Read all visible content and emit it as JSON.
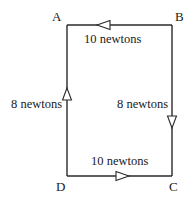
{
  "diagram": {
    "type": "force-loop",
    "vertices": {
      "A": {
        "label": "A",
        "x": 67,
        "y": 25
      },
      "B": {
        "label": "B",
        "x": 172,
        "y": 25
      },
      "C": {
        "label": "C",
        "x": 172,
        "y": 176
      },
      "D": {
        "label": "D",
        "x": 67,
        "y": 176
      }
    },
    "edges": [
      {
        "from": "B",
        "to": "A",
        "label": "10 newtons",
        "direction": "left"
      },
      {
        "from": "B",
        "to": "C",
        "label": "8 newtons",
        "direction": "down"
      },
      {
        "from": "D",
        "to": "C",
        "label": "10 newtons",
        "direction": "right"
      },
      {
        "from": "D",
        "to": "A",
        "label": "8 newtons",
        "direction": "up"
      }
    ],
    "colors": {
      "line": "#2a2a2a",
      "text": "#1a1a1a",
      "background": "#ffffff"
    }
  }
}
